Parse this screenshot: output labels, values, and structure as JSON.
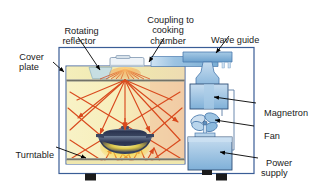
{
  "figure": {
    "background": "#ffffff"
  },
  "labels": {
    "rotating_reflector": "Rotating\nreflector",
    "coupling": "Coupling to\ncooking\nchamber",
    "wave_guide": "Wave guide",
    "cover_plate": "Cover\nplate",
    "turntable": "Turntable",
    "magnetron": "Magnetron",
    "fan": "Fan",
    "power_supply": "Power\nsupply"
  },
  "colors": {
    "outline": "#3a5d96",
    "cabinet_fill": "#ffffff",
    "chamber_fill": "#f7f0c0",
    "chamber_warm": "#f2cfa4",
    "cover_plate_fill": "#f5efbe",
    "component_blue": "#8cb8de",
    "component_blue_dark": "#5e90c4",
    "wave_guide_blue": "#7fb0d8",
    "ray_orange": "#d94a1e",
    "pot_dark": "#2c3550",
    "glow_yellow": "#f5e03a",
    "foot_black": "#1b1b1b",
    "leader_black": "#000000",
    "text": "#1a1a1a"
  },
  "parts": {
    "cabinet": "oven outer cabinet",
    "chamber": "cooking chamber",
    "cover_plate": "cover plate below ceiling",
    "turntable": "turntable shelf",
    "rotating_reflector": "rotating reflector (mode stirrer)",
    "wave_guide": "wave guide duct",
    "magnetron": "magnetron box",
    "fan": "cooling fan",
    "power_supply": "power supply transformer",
    "pot": "covered cooking pot on turntable",
    "feet": 2
  },
  "icons": {
    "ray_arrow": "arrow-head-icon",
    "leader_line": "leader-line-icon"
  }
}
